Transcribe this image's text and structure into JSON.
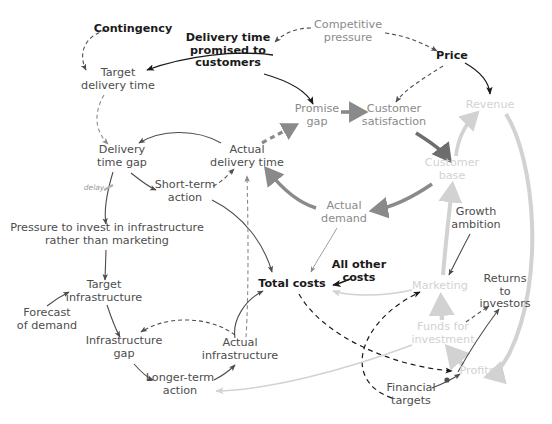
{
  "diagram": {
    "background": "#ffffff",
    "palette": {
      "black": "#1a1a1a",
      "dark_gray": "#4d4d4d",
      "mid_gray": "#8a8a8a",
      "light_gray": "#d2d2d2"
    },
    "nodes": [
      {
        "id": "contingency",
        "label": "Contingency",
        "x": 133,
        "y": 29,
        "tone": "black",
        "size": "fs11"
      },
      {
        "id": "delivery_promised",
        "label": "Delivery time\npromised to\ncustomers",
        "x": 228,
        "y": 51,
        "tone": "black",
        "size": "fs11"
      },
      {
        "id": "competitive",
        "label": "Competitive\npressure",
        "x": 348,
        "y": 32,
        "tone": "mid",
        "size": "fs11"
      },
      {
        "id": "price",
        "label": "Price",
        "x": 452,
        "y": 56,
        "tone": "black",
        "size": "fs11"
      },
      {
        "id": "target_delivery",
        "label": "Target\ndelivery time",
        "x": 118,
        "y": 80,
        "tone": "dark",
        "size": "fs11"
      },
      {
        "id": "promise_gap",
        "label": "Promise\ngap",
        "x": 317,
        "y": 116,
        "tone": "mid",
        "size": "fs11"
      },
      {
        "id": "cust_satisfaction",
        "label": "Customer\nsatisfaction",
        "x": 394,
        "y": 116,
        "tone": "mid",
        "size": "fs11"
      },
      {
        "id": "revenue",
        "label": "Revenue",
        "x": 490,
        "y": 105,
        "tone": "light",
        "size": "fs11"
      },
      {
        "id": "delivery_gap",
        "label": "Delivery\ntime gap",
        "x": 122,
        "y": 157,
        "tone": "dark",
        "size": "fs11"
      },
      {
        "id": "actual_delivery",
        "label": "Actual\ndelivery time",
        "x": 247,
        "y": 157,
        "tone": "dark",
        "size": "fs11"
      },
      {
        "id": "customer_base",
        "label": "Customer\nbase",
        "x": 452,
        "y": 170,
        "tone": "light",
        "size": "fs11"
      },
      {
        "id": "delay",
        "label": "delay",
        "x": 94,
        "y": 188,
        "tone": "delay",
        "size": "fs10"
      },
      {
        "id": "short_term",
        "label": "Short-term\naction",
        "x": 185,
        "y": 192,
        "tone": "dark",
        "size": "fs11"
      },
      {
        "id": "actual_demand",
        "label": "Actual\ndemand",
        "x": 344,
        "y": 213,
        "tone": "mid",
        "size": "fs11"
      },
      {
        "id": "growth_ambition",
        "label": "Growth\nambition",
        "x": 476,
        "y": 219,
        "tone": "dark",
        "size": "fs11"
      },
      {
        "id": "pressure_invest",
        "label": "Pressure to invest in infrastructure\nrather than marketing",
        "x": 107,
        "y": 235,
        "tone": "dark",
        "size": "fs11"
      },
      {
        "id": "all_other_costs",
        "label": "All other\ncosts",
        "x": 359,
        "y": 272,
        "tone": "black",
        "size": "fs11"
      },
      {
        "id": "total_costs",
        "label": "Total costs",
        "x": 292,
        "y": 284,
        "tone": "black",
        "size": "fs11"
      },
      {
        "id": "target_infra",
        "label": "Target\ninfrastructure",
        "x": 104,
        "y": 292,
        "tone": "dark",
        "size": "fs11"
      },
      {
        "id": "marketing",
        "label": "Marketing",
        "x": 440,
        "y": 286,
        "tone": "light",
        "size": "fs11"
      },
      {
        "id": "returns_investors",
        "label": "Returns to\ninvestors",
        "x": 505,
        "y": 292,
        "tone": "dark",
        "size": "fs11"
      },
      {
        "id": "forecast_demand",
        "label": "Forecast\nof demand",
        "x": 47,
        "y": 320,
        "tone": "dark",
        "size": "fs11"
      },
      {
        "id": "funds_investment",
        "label": "Funds for\ninvestment",
        "x": 443,
        "y": 334,
        "tone": "light",
        "size": "fs11"
      },
      {
        "id": "infra_gap",
        "label": "Infrastructure\ngap",
        "x": 124,
        "y": 348,
        "tone": "dark",
        "size": "fs11"
      },
      {
        "id": "actual_infra",
        "label": "Actual\ninfrastructure",
        "x": 240,
        "y": 350,
        "tone": "dark",
        "size": "fs11"
      },
      {
        "id": "longer_term",
        "label": "Longer-term\naction",
        "x": 180,
        "y": 385,
        "tone": "dark",
        "size": "fs11"
      },
      {
        "id": "profits",
        "label": "Profits",
        "x": 477,
        "y": 371,
        "tone": "light",
        "size": "fs11"
      },
      {
        "id": "financial_targets",
        "label": "Financial\ntargets",
        "x": 411,
        "y": 395,
        "tone": "dark",
        "size": "fs11"
      }
    ],
    "links": [
      {
        "from": "contingency",
        "to": "target_delivery",
        "style": "dashed",
        "weight": "thin",
        "color": "#4d4d4d"
      },
      {
        "from": "delivery_promised",
        "to": "target_delivery",
        "style": "solid",
        "weight": "thin",
        "color": "#1a1a1a"
      },
      {
        "from": "competitive",
        "to": "delivery_promised",
        "style": "dashed",
        "weight": "thin",
        "color": "#4d4d4d"
      },
      {
        "from": "competitive",
        "to": "price",
        "style": "dashed",
        "weight": "thin",
        "color": "#4d4d4d"
      },
      {
        "from": "delivery_promised",
        "to": "promise_gap",
        "style": "solid",
        "weight": "thin",
        "color": "#1a1a1a"
      },
      {
        "from": "price",
        "to": "cust_satisfaction",
        "style": "dashed",
        "weight": "thin",
        "color": "#4d4d4d"
      },
      {
        "from": "price",
        "to": "revenue",
        "style": "solid",
        "weight": "thin",
        "color": "#1a1a1a"
      },
      {
        "from": "target_delivery",
        "to": "delivery_gap",
        "style": "dashed",
        "weight": "thin",
        "color": "#8a8a8a"
      },
      {
        "from": "actual_delivery",
        "to": "delivery_gap",
        "style": "solid",
        "weight": "thin",
        "color": "#4d4d4d"
      },
      {
        "from": "actual_delivery",
        "to": "promise_gap",
        "style": "dashed",
        "weight": "thick",
        "color": "#8a8a8a"
      },
      {
        "from": "promise_gap",
        "to": "cust_satisfaction",
        "style": "solid",
        "weight": "thick",
        "color": "#8a8a8a"
      },
      {
        "from": "cust_satisfaction",
        "to": "customer_base",
        "style": "solid",
        "weight": "thick",
        "color": "#6d6d6d"
      },
      {
        "from": "customer_base",
        "to": "revenue",
        "style": "solid",
        "weight": "thick",
        "color": "#d2d2d2"
      },
      {
        "from": "customer_base",
        "to": "actual_demand",
        "style": "solid",
        "weight": "thick",
        "color": "#8a8a8a"
      },
      {
        "from": "actual_demand",
        "to": "actual_delivery",
        "style": "solid",
        "weight": "thick",
        "color": "#8a8a8a"
      },
      {
        "from": "delivery_gap",
        "to": "short_term",
        "style": "solid",
        "weight": "thin",
        "color": "#4d4d4d"
      },
      {
        "from": "short_term",
        "to": "actual_delivery",
        "style": "dashed",
        "weight": "thin",
        "color": "#4d4d4d"
      },
      {
        "from": "short_term",
        "to": "total_costs",
        "style": "solid",
        "weight": "thin",
        "color": "#4d4d4d"
      },
      {
        "from": "delivery_gap",
        "to": "pressure_invest",
        "style": "solid",
        "weight": "thin",
        "color": "#4d4d4d",
        "label": "delay"
      },
      {
        "from": "pressure_invest",
        "to": "target_infra",
        "style": "solid",
        "weight": "thin",
        "color": "#4d4d4d"
      },
      {
        "from": "forecast_demand",
        "to": "target_infra",
        "style": "solid",
        "weight": "thin",
        "color": "#4d4d4d"
      },
      {
        "from": "target_infra",
        "to": "infra_gap",
        "style": "solid",
        "weight": "thin",
        "color": "#4d4d4d"
      },
      {
        "from": "actual_infra",
        "to": "infra_gap",
        "style": "dashed",
        "weight": "thin",
        "color": "#4d4d4d"
      },
      {
        "from": "infra_gap",
        "to": "longer_term",
        "style": "solid",
        "weight": "thin",
        "color": "#4d4d4d"
      },
      {
        "from": "longer_term",
        "to": "actual_infra",
        "style": "solid",
        "weight": "thin",
        "color": "#4d4d4d"
      },
      {
        "from": "actual_infra",
        "to": "actual_delivery",
        "style": "dashed",
        "weight": "thin",
        "color": "#8a8a8a"
      },
      {
        "from": "actual_infra",
        "to": "total_costs",
        "style": "solid",
        "weight": "thin",
        "color": "#4d4d4d"
      },
      {
        "from": "actual_demand",
        "to": "total_costs",
        "style": "solid",
        "weight": "thin",
        "color": "#8a8a8a"
      },
      {
        "from": "all_other_costs",
        "to": "total_costs",
        "style": "solid",
        "weight": "thin",
        "color": "#1a1a1a"
      },
      {
        "from": "marketing",
        "to": "total_costs",
        "style": "solid",
        "weight": "thin",
        "color": "#d2d2d2"
      },
      {
        "from": "total_costs",
        "to": "profits",
        "style": "dashed",
        "weight": "thin",
        "color": "#1a1a1a"
      },
      {
        "from": "revenue",
        "to": "profits",
        "style": "solid",
        "weight": "thick",
        "color": "#d2d2d2"
      },
      {
        "from": "growth_ambition",
        "to": "marketing",
        "style": "solid",
        "weight": "thin",
        "color": "#4d4d4d"
      },
      {
        "from": "marketing",
        "to": "customer_base",
        "style": "solid",
        "weight": "thick",
        "color": "#d2d2d2"
      },
      {
        "from": "funds_investment",
        "to": "marketing",
        "style": "solid",
        "weight": "thick",
        "color": "#d2d2d2"
      },
      {
        "from": "profits",
        "to": "funds_investment",
        "style": "solid",
        "weight": "thick",
        "color": "#d2d2d2"
      },
      {
        "from": "funds_investment",
        "to": "returns_investors",
        "style": "dashed",
        "weight": "thin",
        "color": "#4d4d4d"
      },
      {
        "from": "returns_investors",
        "to": "profits",
        "style": "solid",
        "weight": "thin",
        "color": "#4d4d4d"
      },
      {
        "from": "financial_targets",
        "to": "profits",
        "style": "solid",
        "weight": "thin",
        "color": "#4d4d4d"
      },
      {
        "from": "financial_targets",
        "to": "marketing",
        "style": "dashed",
        "weight": "thin",
        "color": "#1a1a1a"
      },
      {
        "from": "funds_investment",
        "to": "longer_term",
        "style": "solid",
        "weight": "thin",
        "color": "#d2d2d2"
      }
    ]
  }
}
